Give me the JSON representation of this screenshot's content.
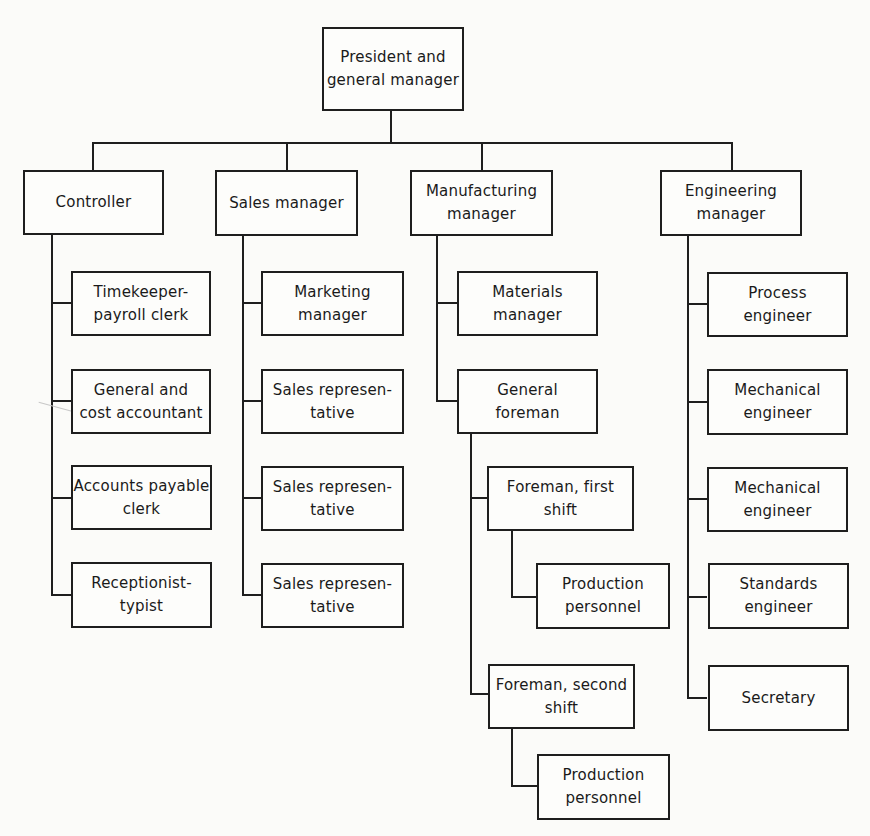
{
  "chart": {
    "type": "organization-chart",
    "root": {
      "lines": [
        "President and",
        "general manager"
      ]
    },
    "departments": [
      {
        "head": {
          "lines": [
            "Controller"
          ]
        },
        "reports": [
          {
            "lines": [
              "Timekeeper-",
              "payroll clerk"
            ]
          },
          {
            "lines": [
              "General and",
              "cost accountant"
            ]
          },
          {
            "lines": [
              "Accounts payable",
              "clerk"
            ]
          },
          {
            "lines": [
              "Receptionist-",
              "typist"
            ]
          }
        ]
      },
      {
        "head": {
          "lines": [
            "Sales manager"
          ]
        },
        "reports": [
          {
            "lines": [
              "Marketing",
              "manager"
            ]
          },
          {
            "lines": [
              "Sales represen-",
              "tative"
            ]
          },
          {
            "lines": [
              "Sales represen-",
              "tative"
            ]
          },
          {
            "lines": [
              "Sales represen-",
              "tative"
            ]
          }
        ]
      },
      {
        "head": {
          "lines": [
            "Manufacturing",
            "manager"
          ]
        },
        "reports": [
          {
            "lines": [
              "Materials",
              "manager"
            ]
          },
          {
            "lines": [
              "General",
              "foreman"
            ],
            "reports": [
              {
                "lines": [
                  "Foreman, first",
                  "shift"
                ],
                "reports": [
                  {
                    "lines": [
                      "Production",
                      "personnel"
                    ]
                  }
                ]
              },
              {
                "lines": [
                  "Foreman, second",
                  "shift"
                ],
                "reports": [
                  {
                    "lines": [
                      "Production",
                      "personnel"
                    ]
                  }
                ]
              }
            ]
          }
        ]
      },
      {
        "head": {
          "lines": [
            "Engineering",
            "manager"
          ]
        },
        "reports": [
          {
            "lines": [
              "Process",
              "engineer"
            ]
          },
          {
            "lines": [
              "Mechanical",
              "engineer"
            ]
          },
          {
            "lines": [
              "Mechanical",
              "engineer"
            ]
          },
          {
            "lines": [
              "Standards",
              "engineer"
            ]
          },
          {
            "lines": [
              "Secretary"
            ]
          }
        ]
      }
    ]
  },
  "colors": {
    "line": "#1e1e1e",
    "background": "#fbfbf9"
  }
}
